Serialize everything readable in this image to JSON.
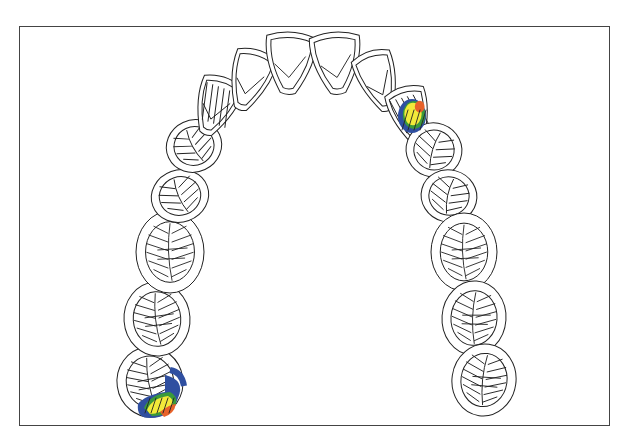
{
  "diagram": {
    "title": "",
    "type": "maxillary occlusal arch chart",
    "frame": {
      "x": 19,
      "y": 26,
      "width": 591,
      "height": 400,
      "border_color": "#444444"
    },
    "teeth": [
      {
        "id": "L-molar-2",
        "side": "left",
        "kind": "molar",
        "cx": 150,
        "cy": 382,
        "w": 66,
        "h": 70,
        "rot": -8,
        "contact": true
      },
      {
        "id": "L-molar-1",
        "side": "left",
        "kind": "molar",
        "cx": 157,
        "cy": 319,
        "w": 66,
        "h": 74,
        "rot": -4,
        "contact": false
      },
      {
        "id": "L-molar-0",
        "side": "left",
        "kind": "molar",
        "cx": 170,
        "cy": 252,
        "w": 68,
        "h": 82,
        "rot": 0,
        "contact": false
      },
      {
        "id": "L-premolar-2",
        "side": "left",
        "kind": "premolar",
        "cx": 180,
        "cy": 196,
        "w": 58,
        "h": 52,
        "rot": -20,
        "contact": false
      },
      {
        "id": "L-premolar-1",
        "side": "left",
        "kind": "premolar",
        "cx": 194,
        "cy": 146,
        "w": 56,
        "h": 52,
        "rot": -25,
        "contact": false
      },
      {
        "id": "L-canine",
        "side": "left",
        "kind": "canine",
        "cx": 216,
        "cy": 105,
        "w": 42,
        "h": 60,
        "rot": 20,
        "contact": false
      },
      {
        "id": "L-lateral",
        "side": "left",
        "kind": "incisor",
        "cx": 250,
        "cy": 79,
        "w": 42,
        "h": 62,
        "rot": 18,
        "contact": false
      },
      {
        "id": "L-central",
        "side": "left",
        "kind": "incisor",
        "cx": 290,
        "cy": 62,
        "w": 50,
        "h": 62,
        "rot": 4,
        "contact": false
      },
      {
        "id": "R-central",
        "side": "right",
        "kind": "incisor",
        "cx": 336,
        "cy": 62,
        "w": 50,
        "h": 62,
        "rot": -4,
        "contact": false
      },
      {
        "id": "R-lateral",
        "side": "right",
        "kind": "incisor",
        "cx": 378,
        "cy": 80,
        "w": 40,
        "h": 62,
        "rot": -18,
        "contact": false
      },
      {
        "id": "R-canine",
        "side": "right",
        "kind": "canine",
        "cx": 410,
        "cy": 114,
        "w": 40,
        "h": 58,
        "rot": -15,
        "contact": true
      },
      {
        "id": "R-premolar-1",
        "side": "right",
        "kind": "premolar",
        "cx": 443,
        "cy": 191,
        "w": 56,
        "h": 54,
        "rot": 20,
        "contact": false
      },
      {
        "id": "R-premolar-2",
        "side": "right",
        "kind": "premolar",
        "cx": 449,
        "cy": 242,
        "w": 56,
        "h": 52,
        "rot": 15,
        "contact": false
      },
      {
        "id": "R-molar-0",
        "side": "right",
        "kind": "molar",
        "cx": 462,
        "cy": 305,
        "w": 66,
        "h": 78,
        "rot": 0,
        "contact": false
      },
      {
        "id": "R-molar-1",
        "side": "right",
        "kind": "molar",
        "cx": 470,
        "cy": 378,
        "w": 64,
        "h": 74,
        "rot": 4,
        "contact": false
      },
      {
        "id": "R-molar-2",
        "side": "right",
        "kind": "molar",
        "cx": 484,
        "cy": 432,
        "w": 64,
        "h": 72,
        "rot": 8,
        "contact": false
      }
    ],
    "contact_colors": {
      "blue": "#2f4fa0",
      "green": "#3a9a3a",
      "yellow": "#f2ea3a",
      "orange": "#e8622a"
    },
    "contact_areas": [
      {
        "tooth": "R-canine",
        "label": "contact-upper-right",
        "cx": 412,
        "cy": 118,
        "rx": 16,
        "ry": 20
      },
      {
        "tooth": "L-molar-2",
        "label": "contact-lower-left",
        "cx": 158,
        "cy": 398,
        "rx": 22,
        "ry": 20
      }
    ]
  }
}
